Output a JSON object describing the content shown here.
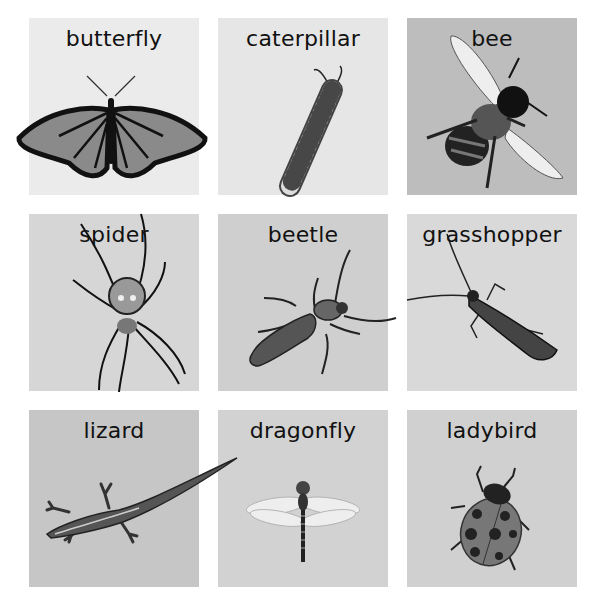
{
  "cards": [
    {
      "label": "butterfly",
      "bg": "#ebebeb",
      "icon": "butterfly-icon"
    },
    {
      "label": "caterpillar",
      "bg": "#e6e6e6",
      "icon": "caterpillar-icon"
    },
    {
      "label": "bee",
      "bg": "#bdbdbd",
      "icon": "bee-icon"
    },
    {
      "label": "spider",
      "bg": "#d6d6d6",
      "icon": "spider-icon"
    },
    {
      "label": "beetle",
      "bg": "#cfcfcf",
      "icon": "beetle-icon"
    },
    {
      "label": "grasshopper",
      "bg": "#d9d9d9",
      "icon": "grasshopper-icon"
    },
    {
      "label": "lizard",
      "bg": "#c6c6c6",
      "icon": "lizard-icon"
    },
    {
      "label": "dragonfly",
      "bg": "#d2d2d2",
      "icon": "dragonfly-icon"
    },
    {
      "label": "ladybird",
      "bg": "#d0d0d0",
      "icon": "ladybird-icon"
    }
  ]
}
